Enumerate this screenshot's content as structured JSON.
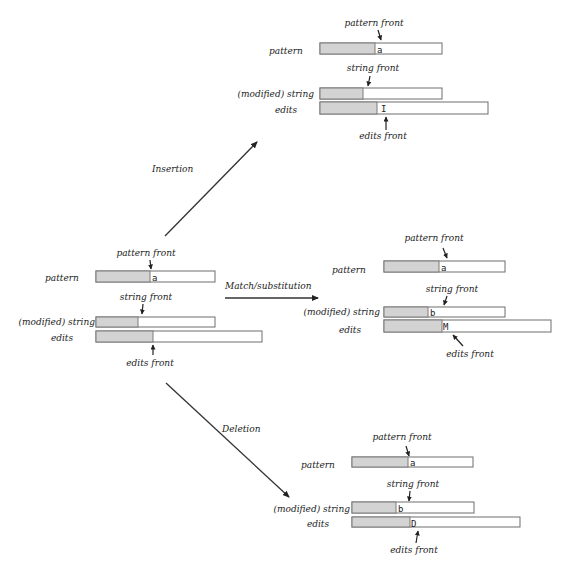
{
  "operations": {
    "insertion": {
      "label": "Insertion"
    },
    "match": {
      "label": "Match/substitution"
    },
    "deletion": {
      "label": "Deletion"
    }
  },
  "states": {
    "initial": {
      "pattern_label": "pattern",
      "string_label": "(modified) string",
      "edits_label": "edits",
      "pattern_front": "pattern front",
      "string_front": "string front",
      "edits_front": "edits front",
      "pattern_char": "a",
      "string_char": "",
      "edits_char": ""
    },
    "insertion": {
      "pattern_label": "pattern",
      "string_label": "(modified) string",
      "edits_label": "edits",
      "pattern_front": "pattern front",
      "string_front": "string front",
      "edits_front": "edits front",
      "pattern_char": "a",
      "string_char": "",
      "edits_char": "I"
    },
    "match": {
      "pattern_label": "pattern",
      "string_label": "(modified) string",
      "edits_label": "edits",
      "pattern_front": "pattern front",
      "string_front": "string front",
      "edits_front": "edits front",
      "pattern_char": "a",
      "string_char": "b",
      "edits_char": "M"
    },
    "deletion": {
      "pattern_label": "pattern",
      "string_label": "(modified) string",
      "edits_label": "edits",
      "pattern_front": "pattern front",
      "string_front": "string front",
      "edits_front": "edits front",
      "pattern_char": "a",
      "string_char": "b",
      "edits_char": "D"
    }
  },
  "colors": {
    "processed_fill": "#d3d3d3",
    "box_border": "#6e6e6e",
    "text": "#222222"
  }
}
